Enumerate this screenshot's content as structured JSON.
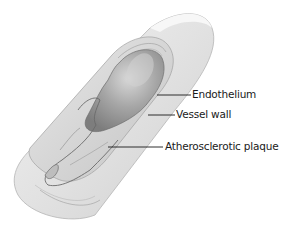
{
  "figure": {
    "labels": [
      {
        "id": "endothelium",
        "text": "Endothelium"
      },
      {
        "id": "vessel-wall",
        "text": "Vessel wall"
      },
      {
        "id": "plaque",
        "text": "Atherosclerotic plaque"
      }
    ],
    "colors": {
      "background": "#ffffff",
      "outer_wall": "#e4e4e4",
      "wall_layers": "#c8c8c8",
      "lumen": "#a9a9a9",
      "lumen_highlight": "#d6d6d6",
      "plaque": "#cfcfcf",
      "leader_line": "#1a1a1a"
    }
  }
}
